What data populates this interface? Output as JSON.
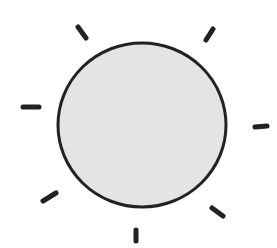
{
  "illustration": {
    "subject": "hand-drawn sun",
    "colors": {
      "background": "#ffffff",
      "disc_fill": "#e4e4e4",
      "stroke": "#222222"
    },
    "disc": {
      "cx": 142,
      "cy": 125,
      "rx": 84,
      "ry": 82
    },
    "rays": [
      {
        "name": "ray-top-left",
        "x1": 78,
        "y1": 27,
        "x2": 86,
        "y2": 38
      },
      {
        "name": "ray-top-right",
        "x1": 213,
        "y1": 29,
        "x2": 206,
        "y2": 40
      },
      {
        "name": "ray-left",
        "x1": 23,
        "y1": 107,
        "x2": 39,
        "y2": 107
      },
      {
        "name": "ray-right",
        "x1": 255,
        "y1": 127,
        "x2": 267,
        "y2": 126
      },
      {
        "name": "ray-bottom-left",
        "x1": 43,
        "y1": 201,
        "x2": 56,
        "y2": 193
      },
      {
        "name": "ray-bottom-right",
        "x1": 212,
        "y1": 208,
        "x2": 223,
        "y2": 216
      },
      {
        "name": "ray-bottom",
        "x1": 136,
        "y1": 230,
        "x2": 136,
        "y2": 241
      }
    ]
  }
}
